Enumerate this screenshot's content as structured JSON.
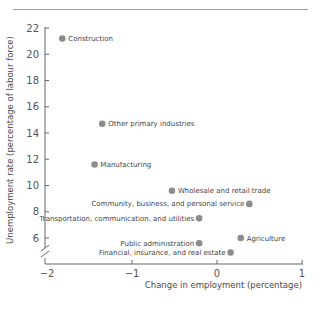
{
  "chart_data": {
    "type": "scatter",
    "title": "",
    "xlabel": "Change in employment (percentage)",
    "ylabel": "Unemployment rate (percentage of labour force)",
    "xlim": [
      -2,
      1
    ],
    "ylim": [
      5,
      22
    ],
    "x_ticks": [
      "−2",
      "−1",
      "0",
      "1"
    ],
    "y_ticks": [
      "6",
      "8",
      "10",
      "12",
      "14",
      "16",
      "18",
      "20",
      "22"
    ],
    "y_axis_break": true,
    "grid": false,
    "marker_color": "#8c8c8c",
    "points": [
      {
        "label": "Construction",
        "x": -1.82,
        "y": 21.2,
        "label_side": "right"
      },
      {
        "label": "Other primary industries",
        "x": -1.35,
        "y": 14.7,
        "label_side": "right"
      },
      {
        "label": "Manufacturing",
        "x": -1.44,
        "y": 11.6,
        "label_side": "right"
      },
      {
        "label": "Wholesale and retail trade",
        "x": -0.53,
        "y": 9.6,
        "label_side": "right"
      },
      {
        "label": "Community, business, and personal service",
        "x": 0.38,
        "y": 8.6,
        "label_side": "left"
      },
      {
        "label": "Transportation, communication, and utilities",
        "x": -0.21,
        "y": 7.5,
        "label_side": "left"
      },
      {
        "label": "Agriculture",
        "x": 0.28,
        "y": 6.0,
        "label_side": "right"
      },
      {
        "label": "Public administration",
        "x": -0.21,
        "y": 5.6,
        "label_side": "left"
      },
      {
        "label": "Financial, insurance, and real estate",
        "x": 0.16,
        "y": 4.9,
        "label_side": "left"
      }
    ]
  }
}
